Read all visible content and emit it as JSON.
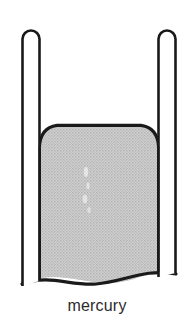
{
  "figure": {
    "title": "mercury",
    "caption": "mercury",
    "background_color": "#ffffff",
    "outline_color": "#1a1a1a",
    "mercury_fill_color": "#c6c6c6",
    "mercury_halftone_color": "#b3b3b3",
    "tube_interior_color": "#ffffff",
    "label_text_color": "#2b2b2b",
    "elements": {
      "left_tube": {
        "name": "left-tube-wall",
        "outer_x": 21,
        "inner_x": 40,
        "top_y": 28,
        "bottom_y": 284,
        "cap": "rounded"
      },
      "right_tube": {
        "name": "right-tube-wall",
        "outer_x": 176,
        "inner_x": 158,
        "top_y": 28,
        "bottom_y": 280,
        "cap": "rounded"
      },
      "mercury_body": {
        "name": "mercury-body",
        "surface_top_y": 125,
        "corner_radius": 17,
        "left_edge_x": 40,
        "right_edge_x": 158,
        "bottom_break_y": 278,
        "surface_shape": "convex"
      },
      "break_line": {
        "name": "bottom-break-line",
        "shape": "wavy",
        "y": 278
      }
    }
  }
}
